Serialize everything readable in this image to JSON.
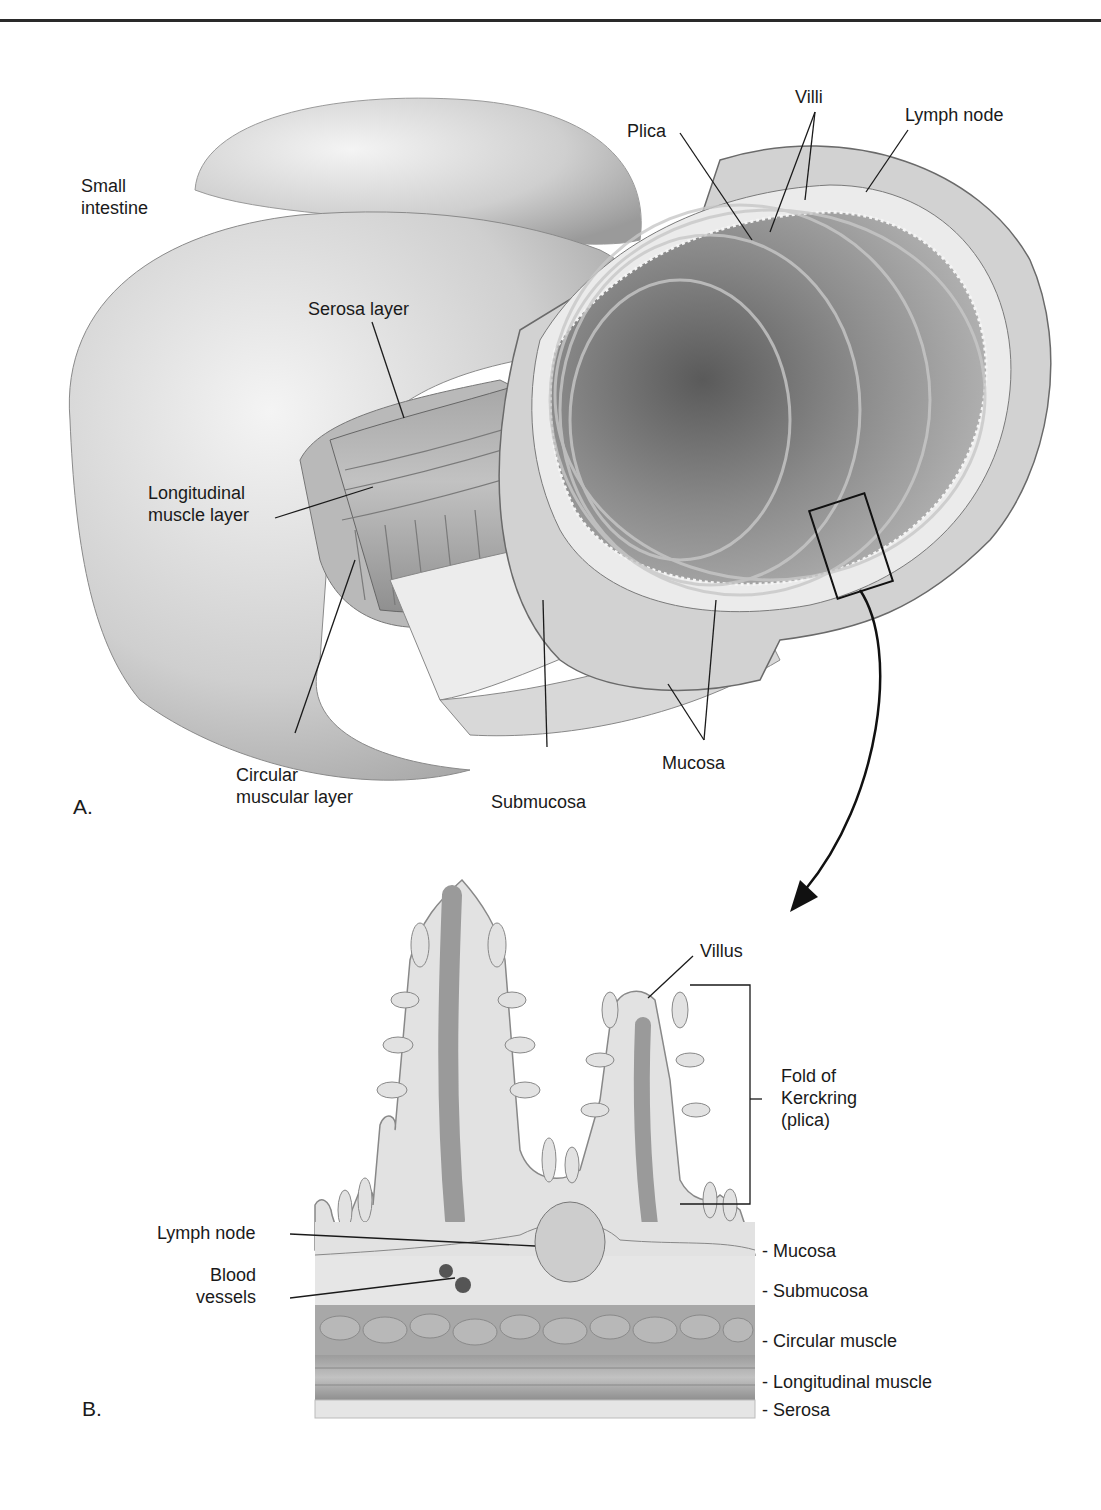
{
  "figure": {
    "panel_a": {
      "letter": "A.",
      "labels": {
        "small_intestine_1": "Small",
        "small_intestine_2": "intestine",
        "serosa_layer": "Serosa layer",
        "longitudinal_1": "Longitudinal",
        "longitudinal_2": "muscle layer",
        "circular_1": "Circular",
        "circular_2": "muscular layer",
        "submucosa": "Submucosa",
        "mucosa": "Mucosa",
        "plica": "Plica",
        "villi": "Villi",
        "lymph_node": "Lymph node"
      }
    },
    "panel_b": {
      "letter": "B.",
      "labels": {
        "villus": "Villus",
        "fold_1": "Fold of",
        "fold_2": "Kerckring",
        "fold_3": "(plica)",
        "lymph_node": "Lymph node",
        "blood_1": "Blood",
        "blood_2": "vessels",
        "mucosa": "- Mucosa",
        "submucosa": "- Submucosa",
        "circular_muscle": "- Circular muscle",
        "longitudinal_muscle": "- Longitudinal muscle",
        "serosa": "- Serosa"
      }
    },
    "colors": {
      "ink": "#1a1a1a",
      "tissue_light": "#e4e4e4",
      "tissue_mid": "#bdbdbd",
      "tissue_dark": "#8a8a8a",
      "muscle": "#a9a9a9"
    }
  }
}
